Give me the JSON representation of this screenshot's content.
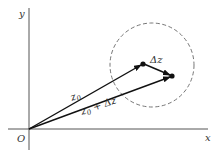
{
  "diagram": {
    "axes": {
      "x_label": "x",
      "y_label": "y",
      "origin_label": "O"
    },
    "vectors": [
      {
        "label": "z0",
        "label_base": "z",
        "label_sub": "0",
        "label_rest": ""
      },
      {
        "label": "z0 + Δz",
        "label_base": "z",
        "label_sub": "0",
        "label_rest": " + Δz"
      },
      {
        "label": "Δz"
      }
    ],
    "circle": {
      "style": "dashed"
    },
    "colors": {
      "axis": "#555555",
      "vector": "#111111",
      "circle": "#666666",
      "text": "#333333"
    }
  }
}
